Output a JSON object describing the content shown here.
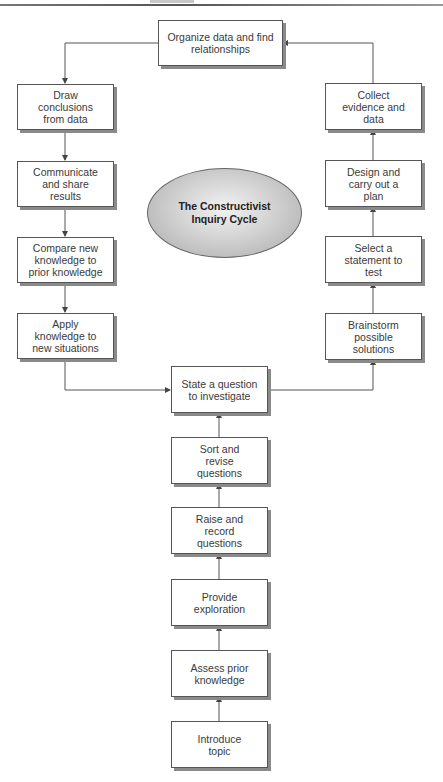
{
  "diagram": {
    "title": "The Constructivist\nInquiry Cycle",
    "top": {
      "label": "Organize data and find\nrelationships"
    },
    "left_column": [
      {
        "label": "Draw\nconclusions\nfrom data"
      },
      {
        "label": "Communicate\nand share\nresults"
      },
      {
        "label": "Compare new\nknowledge to\nprior knowledge"
      },
      {
        "label": "Apply\nknowledge to\nnew situations"
      }
    ],
    "right_column": [
      {
        "label": "Collect\nevidence and\ndata"
      },
      {
        "label": "Design and\ncarry out a\nplan"
      },
      {
        "label": "Select a\nstatement to\ntest"
      },
      {
        "label": "Brainstorm\npossible\nsolutions"
      }
    ],
    "center_column": [
      {
        "label": "State a question\nto investigate"
      },
      {
        "label": "Sort and\nrevise\nquestions"
      },
      {
        "label": "Raise and\nrecord\nquestions"
      },
      {
        "label": "Provide\nexploration"
      },
      {
        "label": "Assess prior\nknowledge"
      },
      {
        "label": "Introduce\ntopic"
      }
    ],
    "colors": {
      "box_border": "#555555",
      "box_shadow": "#8a8a8a",
      "ellipse_fill": "#c8c8c8",
      "arrow": "#444444"
    }
  }
}
